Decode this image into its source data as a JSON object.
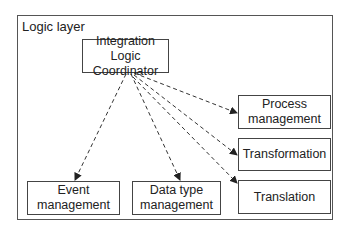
{
  "diagram": {
    "container": {
      "label": "Logic layer"
    },
    "nodes": {
      "coordinator": {
        "label_line1": "Integration Logic",
        "label_line2": "Coordinator"
      },
      "process": {
        "label_line1": "Process",
        "label_line2": "management"
      },
      "transformation": {
        "label": "Transformation"
      },
      "translation": {
        "label": "Translation"
      },
      "event": {
        "label_line1": "Event",
        "label_line2": "management"
      },
      "datatype": {
        "label_line1": "Data type",
        "label_line2": "management"
      }
    },
    "edges": [
      {
        "from": "coordinator",
        "to": "event",
        "style": "dashed"
      },
      {
        "from": "coordinator",
        "to": "datatype",
        "style": "dashed"
      },
      {
        "from": "coordinator",
        "to": "process",
        "style": "dashed"
      },
      {
        "from": "coordinator",
        "to": "transformation",
        "style": "dashed"
      },
      {
        "from": "coordinator",
        "to": "translation",
        "style": "dashed"
      }
    ],
    "colors": {
      "line": "#333333",
      "background": "#ffffff"
    }
  }
}
